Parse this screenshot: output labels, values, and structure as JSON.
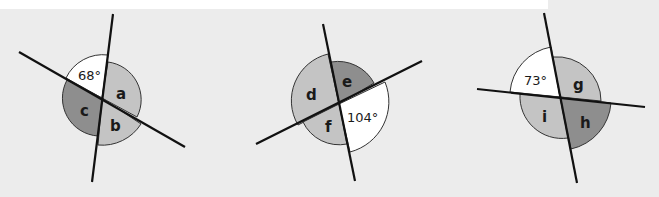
{
  "diagrams": [
    {
      "id": "diagram-1",
      "known_angle": "68°",
      "unknown_labels": [
        "a",
        "b",
        "c"
      ]
    },
    {
      "id": "diagram-2",
      "known_angle": "104°",
      "unknown_labels": [
        "d",
        "e",
        "f"
      ]
    },
    {
      "id": "diagram-3",
      "known_angle": "73°",
      "unknown_labels": [
        "g",
        "h",
        "i"
      ]
    }
  ],
  "colors": {
    "background": "#ececec",
    "light_sector": "#c4c4c4",
    "dark_sector": "#8e8e8e",
    "known_sector": "#ffffff",
    "line": "#111111"
  }
}
